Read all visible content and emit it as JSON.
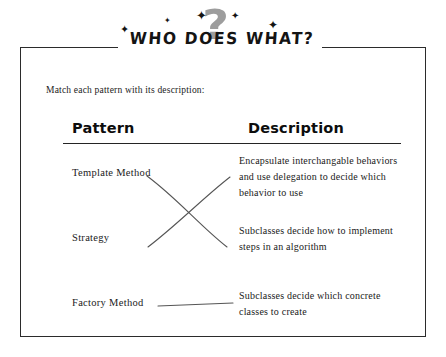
{
  "banner": {
    "title": "WHO DOES WHAT?",
    "question_mark": "?",
    "stars": [
      "✦",
      "✦",
      "✦",
      "✦",
      "✦"
    ]
  },
  "instruction": "Match each pattern with its description:",
  "table": {
    "headers": {
      "pattern": "Pattern",
      "description": "Description"
    },
    "patterns": [
      "Template Method",
      "Strategy",
      "Factory Method"
    ],
    "descriptions": [
      "Encapsulate interchangable behaviors and use delegation to decide which behavior to use",
      "Subclasses decide how to implement steps in an algorithm",
      "Subclasses decide which concrete classes to create"
    ]
  },
  "connections": [
    {
      "from": "Template Method",
      "to": "Subclasses decide how to implement steps in an algorithm"
    },
    {
      "from": "Strategy",
      "to": "Encapsulate interchangable behaviors and use delegation to decide which behavior to use"
    },
    {
      "from": "Factory Method",
      "to": "Subclasses decide which concrete classes to create"
    }
  ],
  "colors": {
    "ink": "#1a1a1a",
    "frame": "#2b2b2b",
    "question_mark": "#8c8c8c",
    "line": "#555555",
    "background": "#ffffff"
  }
}
